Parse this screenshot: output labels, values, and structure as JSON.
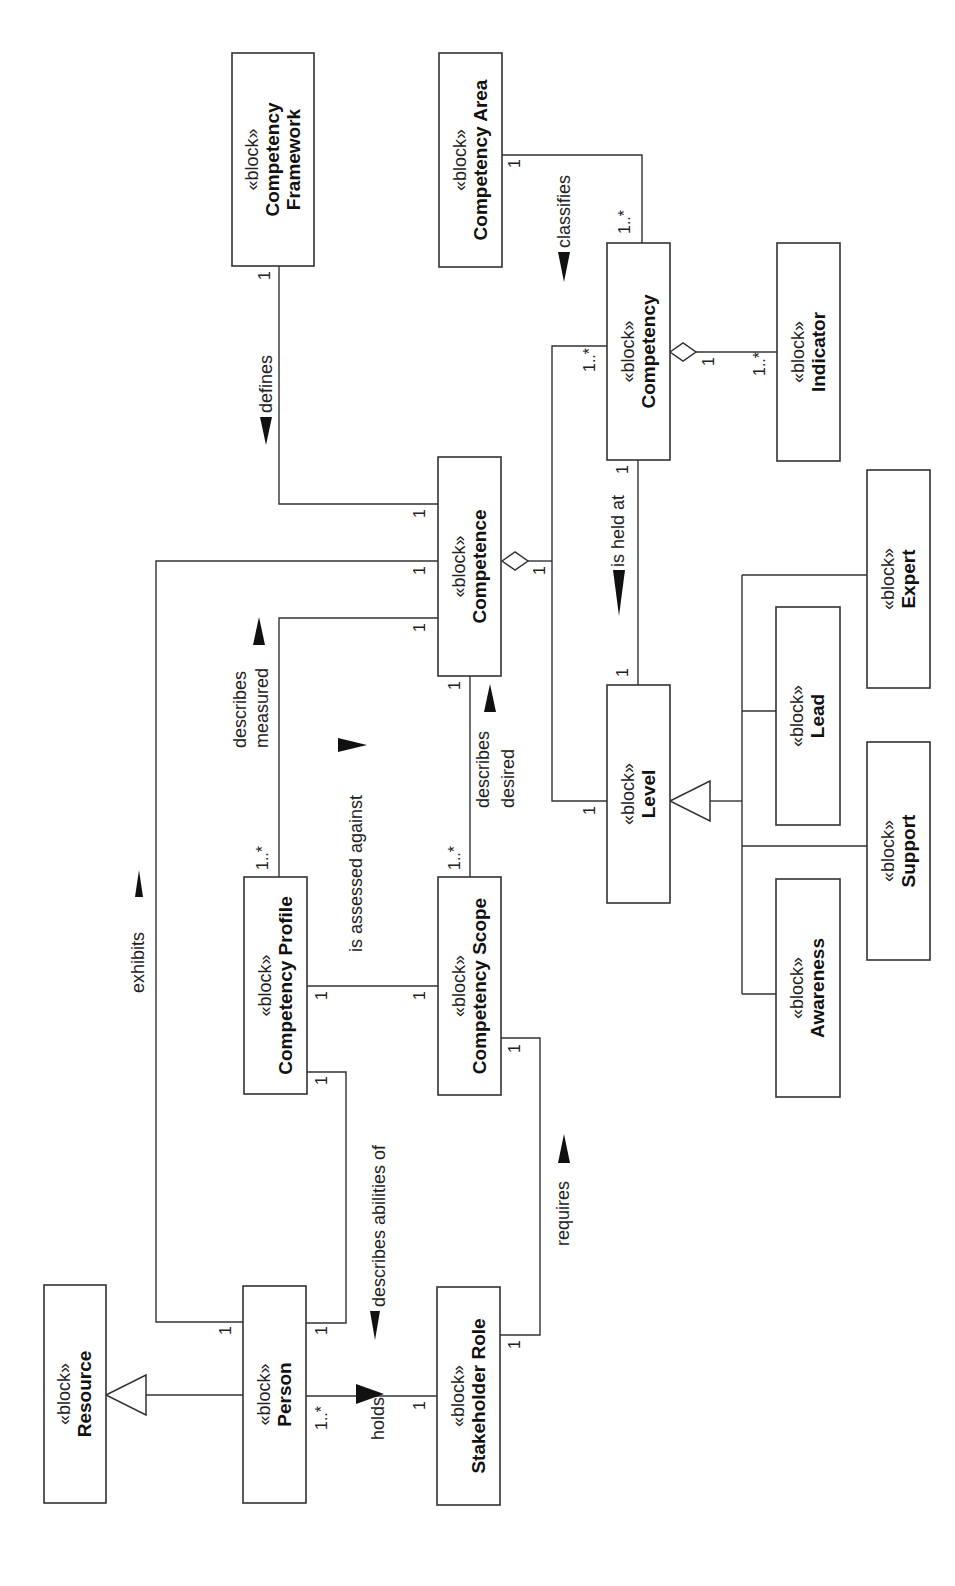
{
  "diagram": {
    "type": "SysML block definition diagram (rotated 90° counter-clockwise)",
    "stereotype": "«block»",
    "blocks": [
      {
        "id": "resource",
        "name": [
          "Resource"
        ],
        "x": 44,
        "y": 1285,
        "w": 62,
        "h": 218
      },
      {
        "id": "person",
        "name": [
          "Person"
        ],
        "x": 243,
        "y": 1286,
        "w": 63,
        "h": 217
      },
      {
        "id": "stakeholder-role",
        "name": [
          "Stakeholder Role"
        ],
        "x": 437,
        "y": 1287,
        "w": 63,
        "h": 218
      },
      {
        "id": "competency-profile",
        "name": [
          "Competency Profile"
        ],
        "x": 244,
        "y": 877,
        "w": 63,
        "h": 217
      },
      {
        "id": "competency-scope",
        "name": [
          "Competency Scope"
        ],
        "x": 438,
        "y": 877,
        "w": 63,
        "h": 218
      },
      {
        "id": "competence",
        "name": [
          "Competence"
        ],
        "x": 438,
        "y": 457,
        "w": 63,
        "h": 219
      },
      {
        "id": "competency-framework",
        "name": [
          "Competency",
          "Framework"
        ],
        "x": 232,
        "y": 53,
        "w": 82,
        "h": 213
      },
      {
        "id": "competency-area",
        "name": [
          "Competency Area"
        ],
        "x": 439,
        "y": 53,
        "w": 63,
        "h": 214
      },
      {
        "id": "competency",
        "name": [
          "Competency"
        ],
        "x": 607,
        "y": 243,
        "w": 63,
        "h": 217
      },
      {
        "id": "indicator",
        "name": [
          "Indicator"
        ],
        "x": 777,
        "y": 243,
        "w": 63,
        "h": 218
      },
      {
        "id": "level",
        "name": [
          "Level"
        ],
        "x": 607,
        "y": 685,
        "w": 63,
        "h": 218
      },
      {
        "id": "expert",
        "name": [
          "Expert"
        ],
        "x": 867,
        "y": 470,
        "w": 63,
        "h": 218
      },
      {
        "id": "lead",
        "name": [
          "Lead"
        ],
        "x": 776,
        "y": 607,
        "w": 64,
        "h": 218
      },
      {
        "id": "support",
        "name": [
          "Support"
        ],
        "x": 867,
        "y": 742,
        "w": 63,
        "h": 218
      },
      {
        "id": "awareness",
        "name": [
          "Awareness"
        ],
        "x": 776,
        "y": 879,
        "w": 64,
        "h": 218
      }
    ],
    "relationships": [
      {
        "id": "generalization-person-resource",
        "kind": "generalization",
        "from": "Person",
        "to": "Resource"
      },
      {
        "id": "assoc-holds",
        "kind": "association",
        "label": "holds",
        "from": "Person",
        "to": "Stakeholder Role",
        "mult_from": "1..*",
        "mult_to": "1"
      },
      {
        "id": "assoc-exhibits",
        "kind": "association",
        "label": "exhibits",
        "from": "Person",
        "to": "Competence",
        "mult_from": "1",
        "mult_to": "1"
      },
      {
        "id": "assoc-describes-abilities-of",
        "kind": "association",
        "label": "describes abilities of",
        "from": "Competency Profile",
        "to": "Person",
        "mult_from": "1",
        "mult_to": "1"
      },
      {
        "id": "assoc-requires",
        "kind": "association",
        "label": "requires",
        "from": "Stakeholder Role",
        "to": "Competency Scope",
        "mult_from": "1",
        "mult_to": "1"
      },
      {
        "id": "assoc-is-assessed-against",
        "kind": "association",
        "label": "is assessed against",
        "from": "Competency Profile",
        "to": "Competency Scope",
        "mult_from": "1",
        "mult_to": "1"
      },
      {
        "id": "assoc-describes-measured",
        "kind": "association",
        "label": [
          "describes",
          "measured"
        ],
        "from": "Competency Profile",
        "to": "Competence",
        "mult_from": "1..*",
        "mult_to": "1"
      },
      {
        "id": "assoc-describes-desired",
        "kind": "association",
        "label": [
          "describes",
          "desired"
        ],
        "from": "Competency Scope",
        "to": "Competence",
        "mult_from": "1..*",
        "mult_to": "1"
      },
      {
        "id": "assoc-defines",
        "kind": "association",
        "label": "defines",
        "from": "Competency Framework",
        "to": "Competence",
        "mult_from": "1",
        "mult_to": "1"
      },
      {
        "id": "assoc-classifies",
        "kind": "association",
        "label": "classifies",
        "from": "Competency Area",
        "to": "Competency",
        "mult_from": "1",
        "mult_to": "1..*"
      },
      {
        "id": "aggregation-competence-competency",
        "kind": "aggregation",
        "whole": "Competence",
        "part": "Competency",
        "mult_whole": "1",
        "mult_part": "1..*"
      },
      {
        "id": "aggregation-competence-level",
        "kind": "aggregation",
        "whole": "Competence",
        "part": "Level",
        "mult_whole": "1",
        "mult_part": "1"
      },
      {
        "id": "aggregation-competency-indicator",
        "kind": "aggregation",
        "whole": "Competency",
        "part": "Indicator",
        "mult_whole": "1",
        "mult_part": "1..*"
      },
      {
        "id": "assoc-is-held-at",
        "kind": "association",
        "label": "is held at",
        "from": "Competency",
        "to": "Level",
        "mult_from": "1",
        "mult_to": "1"
      },
      {
        "id": "generalization-levels",
        "kind": "generalization",
        "to": "Level",
        "from": [
          "Expert",
          "Lead",
          "Support",
          "Awareness"
        ]
      }
    ]
  },
  "labels": {
    "holds": "holds",
    "exhibits": "exhibits",
    "describes_abilities_of": "describes abilities of",
    "requires": "requires",
    "is_assessed_against": "is assessed against",
    "describes": "describes",
    "measured": "measured",
    "desired": "desired",
    "defines": "defines",
    "classifies": "classifies",
    "is_held_at": "is held at"
  },
  "multiplicities": {
    "one": "1",
    "one_many": "1..*"
  }
}
